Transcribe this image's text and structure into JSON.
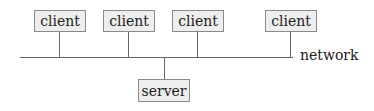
{
  "diagram": {
    "clients": [
      {
        "label": "client",
        "x": 34
      },
      {
        "label": "client",
        "x": 103
      },
      {
        "label": "client",
        "x": 172
      },
      {
        "label": "client",
        "x": 265
      }
    ],
    "server": {
      "label": "server",
      "x": 138
    },
    "network": {
      "label": "network"
    },
    "colors": {
      "box_fill": "#eeeeee",
      "box_border": "#8a8a8a",
      "line": "#666666",
      "text": "#222222"
    }
  }
}
